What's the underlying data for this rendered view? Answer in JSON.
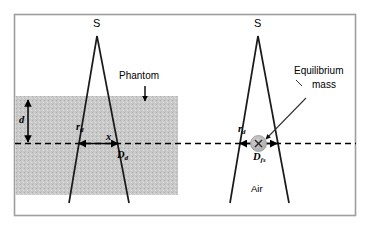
{
  "figure": {
    "type": "schematic-diagram",
    "width": 371,
    "height": 229,
    "background_color": "#ffffff",
    "frame_color": "#9a9a9a",
    "line_color": "#1a1a1a",
    "phantom_fill": "#c9c9c9",
    "mass_fill": "#b4b4b4"
  },
  "left_panel": {
    "source_label": "S",
    "medium_label": "Phantom",
    "depth_label": "d",
    "radius_label": "r",
    "radius_sub": "d",
    "distance_label": "x",
    "diameter_label": "D",
    "diameter_sub": "d"
  },
  "right_panel": {
    "source_label": "S",
    "medium_label": "Air",
    "callout_line1": "Equilibrium",
    "callout_line2": "mass",
    "radius_label": "r",
    "radius_sub": "d",
    "diameter_label": "D",
    "diameter_sub": "fs",
    "mass_marker": "x-marker-icon"
  },
  "annotations": {
    "phantom_arrow": "down-arrow-icon",
    "depth_arrow": "double-vertical-arrow-icon",
    "left_span_arrow": "double-horizontal-arrow-icon",
    "right_span_arrow": "double-horizontal-arrow-icon",
    "callout_arrow": "pointer-arrow-icon",
    "axis": "horizontal-dashed-axis"
  }
}
